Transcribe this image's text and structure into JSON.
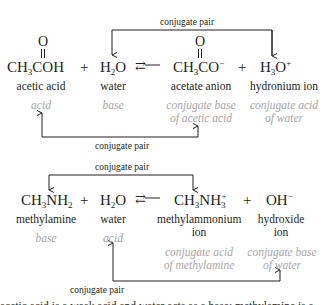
{
  "reaction1": {
    "top_label": "conjugate pair",
    "bottom_label": "conjugate pair",
    "species": [
      {
        "formula_parts": [
          "CH",
          "3",
          "COH"
        ],
        "carbonyl": "O",
        "name": "acetic acid",
        "role": "acid"
      },
      {
        "formula_parts": [
          "H",
          "2",
          "O"
        ],
        "name": "water",
        "role": "base"
      },
      {
        "formula_parts": [
          "CH",
          "3",
          "CO",
          "−"
        ],
        "carbonyl": "O",
        "name": "acetate anion",
        "role_line1": "conjugate base",
        "role_line2": "of acetic acid"
      },
      {
        "formula_parts": [
          "H",
          "3",
          "O",
          "+"
        ],
        "name": "hydronium ion",
        "role_line1": "conjugate acid",
        "role_line2": "of water"
      }
    ],
    "plus": "+",
    "equilibrium": "⇄"
  },
  "reaction2": {
    "top_label": "conjugate pair",
    "bottom_label": "conjugate pair",
    "species": [
      {
        "formula_parts": [
          "CH",
          "3",
          "NH",
          "2"
        ],
        "name": "methylamine",
        "role": "base"
      },
      {
        "formula_parts": [
          "H",
          "2",
          "O"
        ],
        "name": "water",
        "role": "acid"
      },
      {
        "formula_parts": [
          "CH",
          "3",
          "NH",
          "3",
          "+"
        ],
        "name_line1": "methylammonium",
        "name_line2": "ion",
        "role_line1": "conjugate acid",
        "role_line2": "of methylamine"
      },
      {
        "formula_parts": [
          "OH",
          "−"
        ],
        "name_line1": "hydroxide",
        "name_line2": "ion",
        "role_line1": "conjugate base",
        "role_line2": "of water"
      }
    ],
    "plus": "+",
    "equilibrium": "⇄"
  },
  "footer_clipped_text": "acetic acid is a weak acid and water acts as a base; methylamine is a weak base and water acts as an acid",
  "colors": {
    "text": "#231f20",
    "role": "#a6a6a6"
  }
}
